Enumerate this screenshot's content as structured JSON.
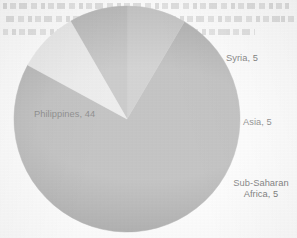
{
  "chart_data": {
    "type": "pie",
    "title": "",
    "subtitle": "",
    "categories": [
      "Philippines",
      "Syria",
      "Asia",
      "Sub-Saharan Africa"
    ],
    "values": [
      44,
      5,
      5,
      5
    ],
    "total": 59,
    "labels": [
      "Philippines, 44",
      "Syria, 5",
      "Asia, 5",
      "Sub-Saharan Africa, 5"
    ],
    "slices": [
      {
        "name": "Philippines",
        "value": 44,
        "label": "Philippines, 44",
        "color": "#8a8a8a",
        "percent": 74.6,
        "start_angle": 30.5,
        "end_angle": 298.5,
        "label_position": "inside"
      },
      {
        "name": "Syria",
        "value": 5,
        "label": "Syria, 5",
        "color": "#a8a8a8",
        "percent": 8.5,
        "start_angle": 0,
        "end_angle": 30.5,
        "label_position": "outside-upper-right"
      },
      {
        "name": "Asia",
        "value": 5,
        "label": "Asia, 5",
        "color": "#999999",
        "percent": 8.5,
        "start_angle": 330,
        "end_angle": 360,
        "label_position": "outside-right"
      },
      {
        "name": "Sub-Saharan Africa",
        "value": 5,
        "label": "Sub-Saharan Africa, 5",
        "label_line1": "Sub-Saharan",
        "label_line2": "Africa, 5",
        "color": "#dcdcdc",
        "percent": 8.5,
        "start_angle": 298.5,
        "end_angle": 330,
        "label_position": "outside-lower-right"
      }
    ],
    "legend": "none",
    "grid": false,
    "xlabel": "",
    "ylabel": ""
  },
  "colors": {
    "philippines": "#8a8a8a",
    "syria": "#a8a8a8",
    "asia": "#999999",
    "subsaharan": "#dcdcdc",
    "label_text": "#2b2b2b",
    "background": "#fdfdfd"
  },
  "geometry": {
    "center_x": 127,
    "center_y": 119,
    "radius": 113
  }
}
